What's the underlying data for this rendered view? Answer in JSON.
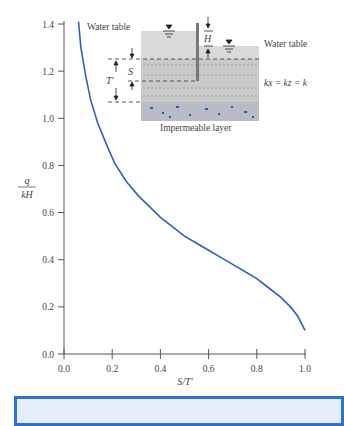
{
  "chart_data": {
    "type": "line",
    "title": "",
    "xlabel": "S/T'",
    "ylabel": "q / kH",
    "xlim": [
      0.0,
      1.0
    ],
    "ylim": [
      0.0,
      1.4
    ],
    "xticks": [
      "0.0",
      "0.2",
      "0.4",
      "0.6",
      "0.8",
      "1.0"
    ],
    "yticks": [
      "0.0",
      "0.2",
      "0.4",
      "0.6",
      "0.8",
      "1.0",
      "1.2",
      "1.4"
    ],
    "grid": false,
    "series": [
      {
        "name": "q/kH vs S/T'",
        "color": "#2d5fc4",
        "x": [
          0.06,
          0.07,
          0.09,
          0.11,
          0.14,
          0.18,
          0.21,
          0.26,
          0.31,
          0.36,
          0.4,
          0.45,
          0.5,
          0.55,
          0.6,
          0.65,
          0.7,
          0.75,
          0.8,
          0.85,
          0.9,
          0.94,
          0.97,
          0.99,
          1.0
        ],
        "y": [
          1.41,
          1.3,
          1.18,
          1.08,
          0.98,
          0.88,
          0.81,
          0.73,
          0.67,
          0.62,
          0.58,
          0.54,
          0.5,
          0.47,
          0.44,
          0.41,
          0.38,
          0.35,
          0.32,
          0.28,
          0.24,
          0.2,
          0.16,
          0.12,
          0.1
        ]
      }
    ],
    "annotations": {
      "inset_labels": [
        "Water table",
        "Water table",
        "H",
        "S",
        "T'",
        "k_x = k_z = k",
        "Impermeable layer"
      ]
    }
  },
  "axis": {
    "x_label_main": "S/T'",
    "y_label_num": "q",
    "y_label_den": "kH"
  },
  "inset": {
    "water_table_left": "Water table",
    "water_table_right": "Water table",
    "h_label": "H",
    "s_label": "S",
    "t_label": "T'",
    "k_eq": "kx = kz = k",
    "impermeable": "Impermeable layer"
  },
  "colors": {
    "curve": "#2d5fc4",
    "axis": "#555555",
    "box_border": "#2e6fd0",
    "box_fill": "#e4eefb"
  }
}
